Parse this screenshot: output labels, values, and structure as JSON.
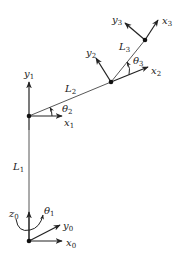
{
  "diagram": {
    "type": "planar-robot-arm-kinematics",
    "colors": {
      "line": "#444444",
      "axis": "#222222",
      "joint": "#111111",
      "background": "#ffffff"
    },
    "links": [
      {
        "label": "L",
        "sub": "1"
      },
      {
        "label": "L",
        "sub": "2"
      },
      {
        "label": "L",
        "sub": "3"
      }
    ],
    "angles": [
      {
        "label": "θ",
        "sub": "1"
      },
      {
        "label": "θ",
        "sub": "2"
      },
      {
        "label": "θ",
        "sub": "3"
      }
    ],
    "frames": [
      {
        "x": {
          "label": "x",
          "sub": "0"
        },
        "y": {
          "label": "y",
          "sub": "0"
        },
        "z": {
          "label": "z",
          "sub": "0"
        }
      },
      {
        "x": {
          "label": "x",
          "sub": "1"
        },
        "y": {
          "label": "y",
          "sub": "1"
        }
      },
      {
        "x": {
          "label": "x",
          "sub": "2"
        },
        "y": {
          "label": "y",
          "sub": "2"
        }
      },
      {
        "x": {
          "label": "x",
          "sub": "3"
        },
        "y": {
          "label": "y",
          "sub": "3"
        }
      }
    ]
  }
}
